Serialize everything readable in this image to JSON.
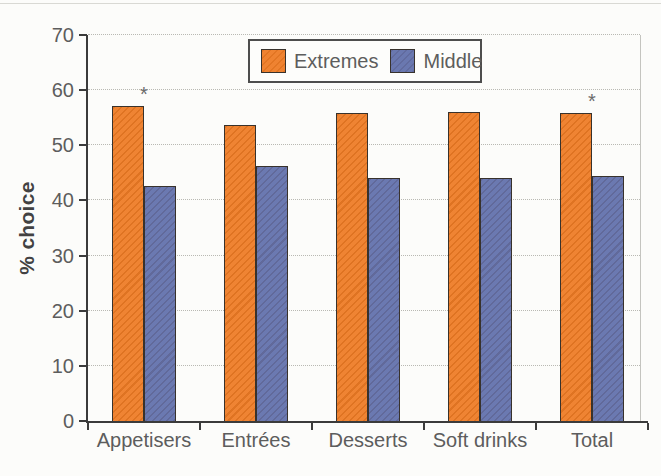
{
  "figure": {
    "background": "#fcfcfa"
  },
  "chart_data": {
    "type": "bar",
    "title": "",
    "xlabel": "",
    "ylabel": "% choice",
    "categories": [
      "Appetisers",
      "Entrées",
      "Desserts",
      "Soft drinks",
      "Total"
    ],
    "series": [
      {
        "name": "Extremes",
        "color": "#ee7c26",
        "values": [
          57.2,
          53.7,
          55.9,
          56.1,
          55.8
        ]
      },
      {
        "name": "Middle",
        "color": "#6271ac",
        "values": [
          42.6,
          46.2,
          44.0,
          44.0,
          44.4
        ]
      }
    ],
    "ylim": [
      0,
      70
    ],
    "yticks": [
      0,
      10,
      20,
      30,
      40,
      50,
      60,
      70
    ],
    "grid": true,
    "gridline_style": "dotted",
    "legend_position": "top-center",
    "annotations": [
      {
        "category": "Appetisers",
        "series": "Extremes",
        "symbol": "*"
      },
      {
        "category": "Total",
        "series": "Extremes",
        "symbol": "*"
      }
    ],
    "colors": {
      "axis": "#3b3b3b",
      "grid": "#b9b9b3",
      "tick_label": "#5d5d5d",
      "bar_border": "#38322c",
      "frame": "#c4c4bf"
    }
  }
}
